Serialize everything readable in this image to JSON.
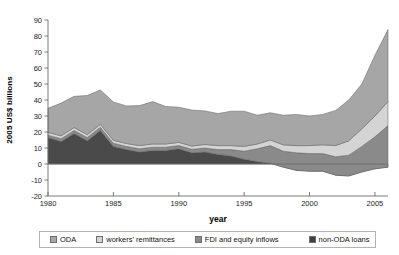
{
  "chart_data": {
    "type": "area",
    "title": "",
    "xlabel": "year",
    "ylabel": "2005 US$ billions",
    "xlim": [
      1980,
      2006
    ],
    "ylim": [
      -20,
      90
    ],
    "ytick_step": 10,
    "grid": false,
    "legend_position": "bottom",
    "xticks": [
      "1980",
      "1985",
      "1990",
      "1995",
      "2000",
      "2005"
    ],
    "yticks": [
      "90",
      "80",
      "70",
      "60",
      "50",
      "40",
      "30",
      "20",
      "10",
      "0",
      "-10",
      "-20"
    ],
    "x": [
      1980,
      1981,
      1982,
      1983,
      1984,
      1985,
      1986,
      1987,
      1988,
      1989,
      1990,
      1991,
      1992,
      1993,
      1994,
      1995,
      1996,
      1997,
      1998,
      1999,
      2000,
      2001,
      2002,
      2003,
      2004,
      2005,
      2006
    ],
    "stack_order": [
      "non-ODA loans",
      "FDI and equity inflows",
      "workers' remittances",
      "ODA"
    ],
    "series": [
      {
        "name": "non-ODA loans",
        "color": "#4a4a4a",
        "values": [
          16.5,
          14.0,
          19.0,
          14.5,
          21.0,
          11.0,
          9.0,
          7.5,
          8.5,
          8.5,
          9.5,
          7.0,
          7.5,
          6.0,
          5.0,
          3.0,
          1.5,
          0.5,
          -2.0,
          -4.0,
          -4.5,
          -4.5,
          -7.0,
          -7.5,
          -5.0,
          -3.0,
          -2.0
        ]
      },
      {
        "name": "workers' remittances",
        "color": "#d4d4d4",
        "values": [
          1.8,
          1.8,
          1.8,
          1.8,
          1.8,
          1.8,
          1.8,
          2.0,
          2.0,
          2.0,
          2.0,
          2.0,
          2.2,
          2.5,
          2.5,
          3.0,
          3.0,
          3.5,
          4.0,
          4.5,
          5.0,
          5.5,
          7.0,
          9.0,
          11.0,
          13.0,
          15.0
        ]
      },
      {
        "name": "FDI and equity inflows",
        "color": "#8a8a8a",
        "values": [
          1.5,
          1.8,
          2.0,
          2.0,
          2.0,
          2.0,
          2.0,
          2.0,
          2.0,
          2.0,
          2.0,
          2.2,
          2.5,
          3.0,
          4.0,
          5.0,
          8.0,
          11.0,
          10.0,
          11.0,
          11.0,
          11.0,
          11.5,
          13.0,
          16.0,
          20.0,
          26.0
        ]
      },
      {
        "name": "ODA",
        "color": "#a6a6a6",
        "values": [
          15.0,
          20.5,
          19.5,
          24.5,
          21.5,
          24.0,
          23.5,
          25.0,
          26.5,
          23.5,
          22.0,
          22.5,
          21.0,
          20.0,
          21.5,
          22.0,
          18.0,
          17.0,
          18.5,
          19.5,
          18.5,
          19.0,
          22.0,
          25.5,
          28.0,
          38.0,
          45.0
        ]
      }
    ],
    "totals": [
      34.8,
      38.1,
      42.3,
      42.8,
      46.3,
      38.8,
      36.3,
      36.5,
      39.0,
      36.0,
      35.5,
      33.7,
      33.2,
      31.5,
      33.0,
      33.0,
      30.5,
      32.0,
      30.5,
      31.0,
      30.0,
      31.0,
      33.5,
      40.0,
      50.0,
      68.0,
      84.0
    ]
  },
  "legend": {
    "items": [
      {
        "label": "ODA",
        "color": "#a6a6a6"
      },
      {
        "label": "workers' remittances",
        "color": "#d4d4d4"
      },
      {
        "label": "FDI and equity inflows",
        "color": "#8a8a8a"
      },
      {
        "label": "non-ODA loans",
        "color": "#3f3f3f"
      }
    ]
  }
}
